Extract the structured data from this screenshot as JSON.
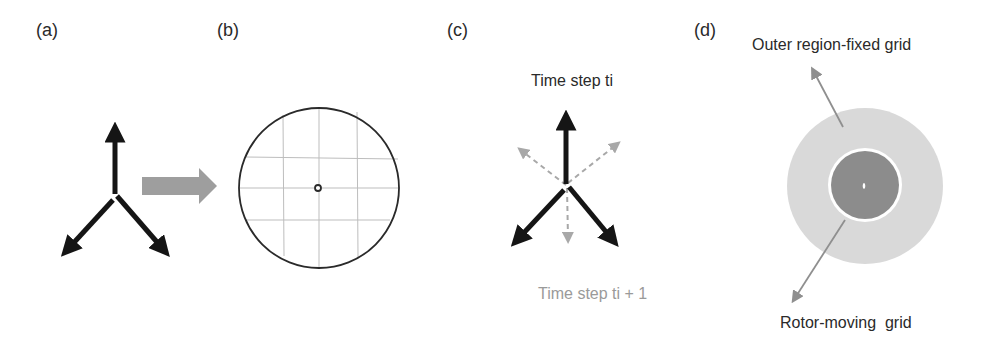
{
  "figure": {
    "panels": [
      {
        "id": "a",
        "label": "(a)"
      },
      {
        "id": "b",
        "label": "(b)"
      },
      {
        "id": "c",
        "label": "(c)"
      },
      {
        "id": "d",
        "label": "(d)"
      }
    ],
    "panel_c": {
      "caption_current": "Time step ti",
      "caption_next": "Time step ti + 1"
    },
    "panel_d": {
      "caption_outer": "Outer region-fixed grid",
      "caption_inner": "Rotor-moving  grid"
    }
  },
  "colors": {
    "dark_arrow": "#151515",
    "block_arrow": "#9e9e9e",
    "dashed_arrow": "#a8a8a8",
    "grid_line": "#bdbdbd",
    "circle_stroke": "#2a2a2a",
    "outer_region_fill": "#d9d9d9",
    "rotor_fill": "#8c8c8c",
    "annotation_arrow": "#8f8f8f",
    "faint_text": "#9a9a9a"
  }
}
